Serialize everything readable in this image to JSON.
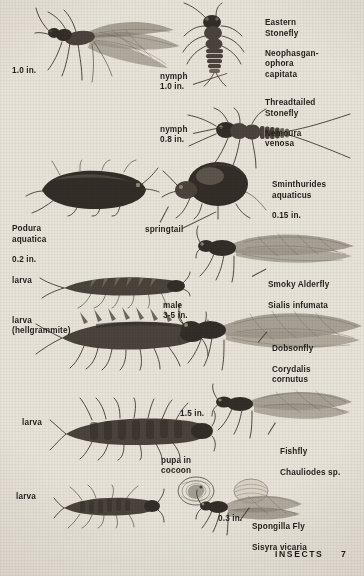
{
  "page": {
    "title": "INSECTS",
    "folio": "7",
    "background_color": "#e9e4da",
    "ink_color": "#332e27"
  },
  "labels": [
    {
      "id": "eastern-stonefly",
      "name": "Eastern\nStonefly",
      "latin": "Neophasgan-\nophora\ncapitata",
      "x": 265,
      "y": 8,
      "style": "mixed"
    },
    {
      "id": "adult-size-1",
      "name": "1.0 in.",
      "x": 12,
      "y": 66,
      "style": "plain"
    },
    {
      "id": "nymph-1",
      "name": "nymph\n1.0 in.",
      "x": 160,
      "y": 72,
      "style": "plain"
    },
    {
      "id": "threadtailed-stonefly",
      "name": "Threadtailed\nStonefly",
      "latin": "Nemoura\nvenosa",
      "x": 265,
      "y": 88,
      "style": "mixed"
    },
    {
      "id": "nymph-2",
      "name": "nymph\n0.8 in.",
      "x": 160,
      "y": 125,
      "style": "plain"
    },
    {
      "id": "sminthurides",
      "name": "",
      "latin": "Sminthurides\naquaticus",
      "measure": "0.15 in.",
      "x": 272,
      "y": 170,
      "style": "latin-measure"
    },
    {
      "id": "podura",
      "name": "",
      "latin": "Podura\naquatica",
      "measure": "0.2 in.",
      "x": 12,
      "y": 214,
      "style": "latin-measure"
    },
    {
      "id": "springtail",
      "name": "springtail",
      "x": 145,
      "y": 225,
      "style": "plain"
    },
    {
      "id": "larva-alderfly",
      "name": "larva",
      "x": 12,
      "y": 276,
      "style": "plain"
    },
    {
      "id": "smoky-alderfly",
      "name": "Smoky Alderfly",
      "latin": "Sialis infumata",
      "x": 268,
      "y": 270,
      "style": "mixed-inline"
    },
    {
      "id": "larva-hellgrammite",
      "name": "larva\n(hellgrammite)",
      "x": 12,
      "y": 316,
      "style": "plain"
    },
    {
      "id": "male-size",
      "name": "male\n3-5 in.",
      "x": 163,
      "y": 301,
      "style": "plain"
    },
    {
      "id": "dobsonfly",
      "name": "Dobsonfly",
      "latin": "Corydalis\ncornutus",
      "x": 272,
      "y": 334,
      "style": "mixed"
    },
    {
      "id": "larva-fishfly",
      "name": "larva",
      "x": 22,
      "y": 418,
      "style": "plain"
    },
    {
      "id": "fishfly-size",
      "name": "1.5 in.",
      "x": 180,
      "y": 409,
      "style": "plain"
    },
    {
      "id": "fishfly",
      "name": "Fishfly",
      "latin": "Chauliodes sp.",
      "x": 280,
      "y": 437,
      "style": "mixed"
    },
    {
      "id": "pupa",
      "name": "pupa in\ncocoon",
      "x": 161,
      "y": 456,
      "style": "plain"
    },
    {
      "id": "larva-spongilla",
      "name": "larva",
      "x": 16,
      "y": 492,
      "style": "plain"
    },
    {
      "id": "spongilla-size",
      "name": "0.3 in.",
      "x": 218,
      "y": 514,
      "style": "plain"
    },
    {
      "id": "spongilla-fly",
      "name": "Spongilla Fly",
      "latin": "Sisyra vicaria",
      "x": 252,
      "y": 512,
      "style": "mixed"
    }
  ],
  "figures": [
    {
      "id": "eastern-stonefly-adult",
      "caption": "Eastern Stonefly adult with outstretched wings"
    },
    {
      "id": "eastern-stonefly-nymph",
      "caption": "Eastern Stonefly nymph"
    },
    {
      "id": "threadtailed-stonefly-nymph",
      "caption": "Threadtailed Stonefly nymph"
    },
    {
      "id": "podura-springtail",
      "caption": "Podura aquatica springtail"
    },
    {
      "id": "sminthurides-springtail",
      "caption": "Sminthurides aquaticus globular springtail"
    },
    {
      "id": "alderfly-larva",
      "caption": "Alderfly larva"
    },
    {
      "id": "smoky-alderfly-adult",
      "caption": "Smoky Alderfly adult"
    },
    {
      "id": "hellgrammite-larva",
      "caption": "Dobsonfly larva, the hellgrammite"
    },
    {
      "id": "dobsonfly-adult",
      "caption": "Dobsonfly male adult"
    },
    {
      "id": "fishfly-larva",
      "caption": "Fishfly larva"
    },
    {
      "id": "fishfly-adult",
      "caption": "Fishfly adult"
    },
    {
      "id": "spongilla-larva",
      "caption": "Spongilla Fly larva"
    },
    {
      "id": "spongilla-pupa",
      "caption": "Spongilla Fly pupa in cocoon"
    },
    {
      "id": "spongilla-fly-adult",
      "caption": "Spongilla Fly adult"
    }
  ]
}
